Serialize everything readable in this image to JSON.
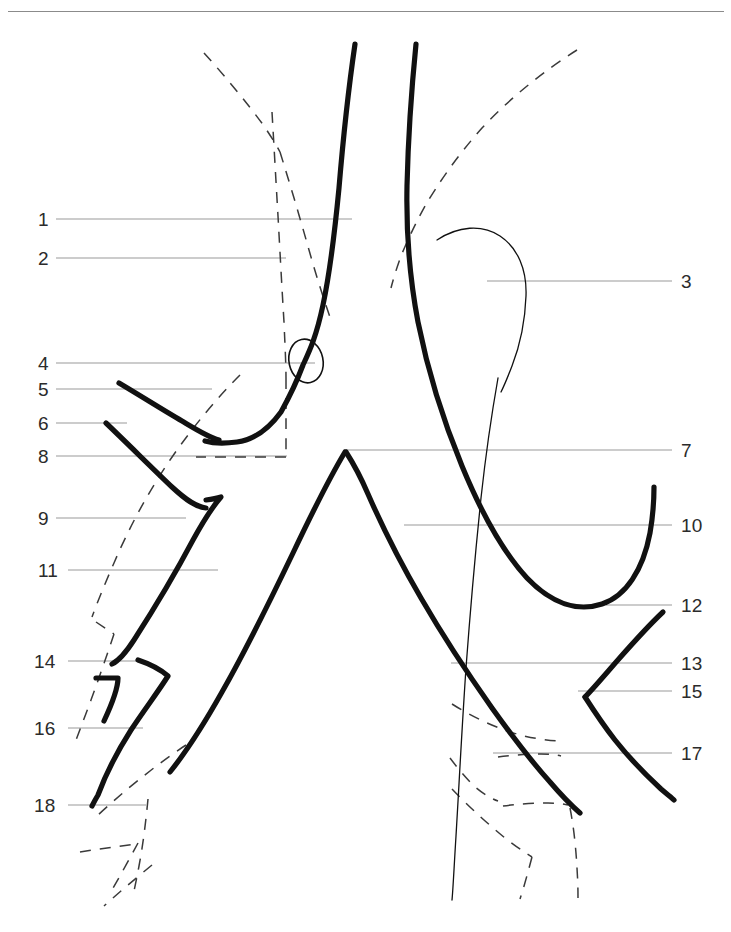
{
  "page": {
    "width": 731,
    "height": 932,
    "background": "#ffffff",
    "kind": "anatomical-line-diagram"
  },
  "header": {
    "rule_visible": true,
    "rule_color": "#8b8b8b"
  },
  "style": {
    "ink_color": "#111111",
    "leader_color": "#9a9a9a",
    "number_color": "#2b2b2b",
    "dashed_color": "#3a3a3a"
  },
  "labels": {
    "left": [
      {
        "id": "1",
        "text": "1",
        "x": 38,
        "y": 210,
        "leader_from": 56,
        "leader_to": 352,
        "leader_y": 219
      },
      {
        "id": "2",
        "text": "2",
        "x": 38,
        "y": 249,
        "leader_from": 56,
        "leader_to": 286,
        "leader_y": 258
      },
      {
        "id": "4",
        "text": "4",
        "x": 38,
        "y": 354,
        "leader_from": 56,
        "leader_to": 315,
        "leader_y": 363
      },
      {
        "id": "5",
        "text": "5",
        "x": 38,
        "y": 380,
        "leader_from": 56,
        "leader_to": 212,
        "leader_y": 389
      },
      {
        "id": "6",
        "text": "6",
        "x": 38,
        "y": 414,
        "leader_from": 56,
        "leader_to": 127,
        "leader_y": 423
      },
      {
        "id": "8",
        "text": "8",
        "x": 38,
        "y": 447,
        "leader_from": 56,
        "leader_to": 287,
        "leader_y": 456
      },
      {
        "id": "9",
        "text": "9",
        "x": 38,
        "y": 509,
        "leader_from": 56,
        "leader_to": 186,
        "leader_y": 518
      },
      {
        "id": "11",
        "text": "11",
        "x": 38,
        "y": 561,
        "leader_from": 68,
        "leader_to": 218,
        "leader_y": 570
      },
      {
        "id": "14",
        "text": "14",
        "x": 34,
        "y": 652,
        "leader_from": 68,
        "leader_to": 138,
        "leader_y": 661
      },
      {
        "id": "16",
        "text": "16",
        "x": 34,
        "y": 719,
        "leader_from": 68,
        "leader_to": 143,
        "leader_y": 728
      },
      {
        "id": "18",
        "text": "18",
        "x": 34,
        "y": 796,
        "leader_from": 68,
        "leader_to": 146,
        "leader_y": 805
      }
    ],
    "right": [
      {
        "id": "3",
        "text": "3",
        "x": 681,
        "y": 272,
        "leader_from": 487,
        "leader_to": 672,
        "leader_y": 281
      },
      {
        "id": "7",
        "text": "7",
        "x": 681,
        "y": 441,
        "leader_from": 346,
        "leader_to": 672,
        "leader_y": 450
      },
      {
        "id": "10",
        "text": "10",
        "x": 681,
        "y": 516,
        "leader_from": 404,
        "leader_to": 672,
        "leader_y": 525
      },
      {
        "id": "12",
        "text": "12",
        "x": 681,
        "y": 596,
        "leader_from": 606,
        "leader_to": 672,
        "leader_y": 605
      },
      {
        "id": "13",
        "text": "13",
        "x": 681,
        "y": 654,
        "leader_from": 451,
        "leader_to": 672,
        "leader_y": 663
      },
      {
        "id": "15",
        "text": "15",
        "x": 681,
        "y": 682,
        "leader_from": 578,
        "leader_to": 672,
        "leader_y": 691
      },
      {
        "id": "17",
        "text": "17",
        "x": 681,
        "y": 744,
        "leader_from": 493,
        "leader_to": 672,
        "leader_y": 753
      }
    ]
  },
  "figure": {
    "vessels_thick": [
      {
        "name": "left-common-carotid-ascending",
        "d": "M 355 44 C 348 92, 343 140, 339 188 C 334 240, 330 272, 323 305 C 316 338, 309 352, 303 365 C 297 381, 291 394, 281 412 C 268 430, 252 440, 237 442 C 222 444, 212 443, 205 441"
      },
      {
        "name": "left-subclavian-upper-branch",
        "d": "M 119 383 C 141 396, 163 410, 182 421 C 197 430, 208 437, 219 440"
      },
      {
        "name": "left-branch-lower",
        "d": "M 106 423 C 128 444, 152 468, 172 487 C 186 500, 196 507, 206 508"
      },
      {
        "name": "left-branch-hook",
        "d": "M 206 500 C 214 499, 218 498, 221 497 C 214 505, 204 520, 193 540 C 175 574, 152 612, 134 640 C 125 654, 118 661, 112 664"
      },
      {
        "name": "left-short-hook-16",
        "d": "M 96 678 C 104 678, 112 678, 118 678 C 118 690, 111 706, 104 721"
      },
      {
        "name": "left-descending-to-18",
        "d": "M 138 660 C 150 664, 160 669, 168 676 C 158 692, 144 710, 131 730 C 117 752, 105 776, 98 795 C 95 800, 93 804, 92 806"
      },
      {
        "name": "aortic-arch-right-descending",
        "d": "M 416 44 C 411 94, 408 144, 407 186 C 406 236, 410 280, 418 322 C 428 372, 443 420, 462 466 C 481 512, 503 552, 527 578 C 552 604, 578 612, 602 604 C 626 596, 643 570, 650 533 C 654 510, 654 500, 654 487"
      },
      {
        "name": "carina-bifurcation-left-limb",
        "d": "M 345 452 C 330 477, 312 513, 293 553 C 270 601, 246 650, 222 692 C 204 724, 186 752, 170 772"
      },
      {
        "name": "carina-bifurcation-right-limb",
        "d": "M 346 452 C 355 466, 362 480, 368 494 C 382 526, 400 562, 421 598 C 443 636, 468 674, 492 708 C 512 736, 532 762, 550 782 C 562 796, 572 806, 580 813"
      },
      {
        "name": "right-branch-lower-12",
        "d": "M 663 612 C 648 626, 632 644, 617 661 C 604 676, 593 689, 585 697"
      },
      {
        "name": "right-branch-descend-15",
        "d": "M 585 697 C 594 711, 604 726, 615 740 C 630 759, 647 776, 661 789 C 668 795, 672 798, 674 800"
      }
    ],
    "vessels_thin": [
      {
        "name": "azygos-arch-hook",
        "d": "M 437 240 C 458 226, 482 224, 500 236 C 518 248, 527 270, 526 296 C 525 324, 519 348, 512 366 C 507 379, 503 388, 501 392"
      },
      {
        "name": "esophagus-midline-thin",
        "d": "M 498 378 C 492 412, 486 452, 481 498 C 475 556, 470 614, 466 668 C 462 726, 459 786, 456 836 C 454 868, 453 890, 452 900"
      }
    ],
    "dashed_outlines": [
      {
        "name": "upper-left-lung-border",
        "d": "M 204 53 C 225 76, 248 104, 264 126 C 272 138, 277 146, 280 152"
      },
      {
        "name": "upper-left-trachea-border",
        "d": "M 272 112 C 274 146, 276 182, 278 216 C 280 252, 282 290, 284 322 C 285 346, 286 364, 286 378"
      },
      {
        "name": "upper-left-inner-border",
        "d": "M 280 152 C 290 184, 300 218, 309 250 C 318 282, 326 306, 331 320"
      },
      {
        "name": "left-vertical-dashed",
        "d": "M 286 378 C 286 400, 286 424, 286 442 C 286 450, 286 454, 286 457"
      },
      {
        "name": "left-box-bottom",
        "d": "M 286 457 L 196 457"
      },
      {
        "name": "upper-right-lung-border",
        "d": "M 577 50 C 545 70, 510 98, 482 128 C 457 156, 438 184, 425 206 C 414 226, 406 244, 401 256 C 396 270, 393 280, 391 288"
      },
      {
        "name": "left-lung-outer-border",
        "d": "M 240 375 C 216 399, 192 428, 170 460 C 147 494, 128 530, 114 563 C 103 588, 96 606, 92 617"
      },
      {
        "name": "left-lower-lung-tick",
        "d": "M 96 622 C 102 626, 108 630, 114 634"
      },
      {
        "name": "left-lung-lower-border",
        "d": "M 114 634 C 107 655, 99 678, 91 700 C 84 719, 79 732, 76 740"
      },
      {
        "name": "rib-upper-left",
        "d": "M 186 745 C 166 758, 143 776, 124 792 C 110 804, 101 812, 96 817"
      },
      {
        "name": "rib-mid-left",
        "d": "M 148 799 C 146 820, 143 845, 139 866 C 136 882, 134 891, 133 896"
      },
      {
        "name": "rib-lower-left-a",
        "d": "M 80 852 C 99 849, 120 846, 136 844"
      },
      {
        "name": "rib-lower-left-b",
        "d": "M 138 843 C 130 858, 120 876, 112 890"
      },
      {
        "name": "rib-lower-left-c",
        "d": "M 152 865 C 135 879, 117 894, 104 906"
      },
      {
        "name": "rib-right-upper",
        "d": "M 452 704 C 474 718, 500 730, 524 736 C 542 740, 554 741, 561 741"
      },
      {
        "name": "rib-right-mid",
        "d": "M 450 758 C 456 766, 464 776, 473 785 C 483 794, 492 799, 498 801"
      },
      {
        "name": "rib-right-mid-top",
        "d": "M 498 757 C 512 755, 528 754, 541 754 C 551 754, 557 755, 561 756"
      },
      {
        "name": "rib-right-lower-a",
        "d": "M 452 789 C 468 806, 488 824, 505 838 C 518 848, 527 854, 532 857"
      },
      {
        "name": "rib-right-lower-b",
        "d": "M 503 806 C 518 804, 535 803, 548 803 C 558 803, 564 804, 568 805"
      },
      {
        "name": "rib-right-lower-c",
        "d": "M 570 808 C 574 828, 576 850, 577 868 C 578 884, 578 893, 578 898"
      },
      {
        "name": "rib-right-lower-d",
        "d": "M 532 857 C 528 872, 524 887, 520 899"
      }
    ],
    "marks": [
      {
        "name": "nodule-ellipse",
        "cx": 306,
        "cy": 361,
        "rx": 17,
        "ry": 22,
        "rotate": -12
      }
    ]
  }
}
